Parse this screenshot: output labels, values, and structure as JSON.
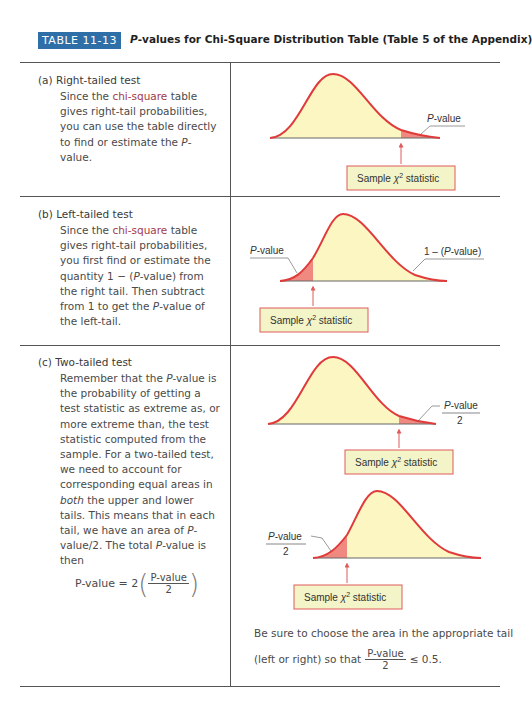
{
  "header": {
    "badge": "TABLE 11-13",
    "title_italic": "P",
    "title_rest": "-values for Chi-Square Distribution Table (Table 5 of the Appendix)"
  },
  "sections": [
    {
      "label": "(a)  Right-tailed test",
      "text_parts": [
        "Since the ",
        "chi-square",
        " table gives right-tail probabilities, you can use the table directly to find or estimate the ",
        "P",
        "-value."
      ],
      "diagram": {
        "tail": "right",
        "tail_label": "P-value",
        "box_label_pre": "Sample ",
        "box_symbol": "χ",
        "box_sup": "2",
        "box_label_post": " statistic"
      }
    },
    {
      "label": "(b)  Left-tailed test",
      "text_parts": [
        "Since the ",
        "chi-square",
        " table gives right-tail probabilities, you first find or estimate the quantity 1 − (",
        "P",
        "-value) from the right tail. Then subtract from 1 to get the ",
        "P",
        "-value of the left-tail."
      ],
      "diagram": {
        "tail": "left",
        "tail_label": "P-value",
        "right_label": "1 – (P-value)",
        "box_label_pre": "Sample ",
        "box_symbol": "χ",
        "box_sup": "2",
        "box_label_post": " statistic"
      }
    },
    {
      "label": "(c)  Two-tailed test",
      "text_parts": [
        "Remember that the ",
        "P",
        "-value is the probability of getting a test statistic as extreme as, or more extreme than, the test statistic computed from the sample. For a two-tailed test, we need to account for corresponding equal areas in ",
        "both",
        " the upper and lower tails. This means that in each tail, we have an area of ",
        "P",
        "-value/2. The total ",
        "P",
        "-value is then"
      ],
      "formula": {
        "lhs": "P-value = 2",
        "num": "P-value",
        "den": "2"
      },
      "diagrams": [
        {
          "tail": "right",
          "tail_label_num": "P-value",
          "tail_label_den": "2",
          "box_label_pre": "Sample ",
          "box_symbol": "χ",
          "box_sup": "2",
          "box_label_post": " statistic"
        },
        {
          "tail": "left",
          "tail_label_num": "P-value",
          "tail_label_den": "2",
          "box_label_pre": "Sample ",
          "box_symbol": "χ",
          "box_sup": "2",
          "box_label_post": " statistic"
        }
      ],
      "note_line1": "Be sure to choose the area in the appropriate tail",
      "note_line2_pre": "(left or right) so that",
      "note_frac_num": "P-value",
      "note_frac_den": "2",
      "note_line2_post": "≤ 0.5."
    }
  ],
  "colors": {
    "badge_bg": "#2f6fa8",
    "curve_stroke": "#e03a3a",
    "curve_fill": "#fbf6c2",
    "tail_fill": "#f08a80",
    "box_fill": "#f3f4c8",
    "box_stroke": "#e05a5a",
    "term": "#a23a4a"
  }
}
